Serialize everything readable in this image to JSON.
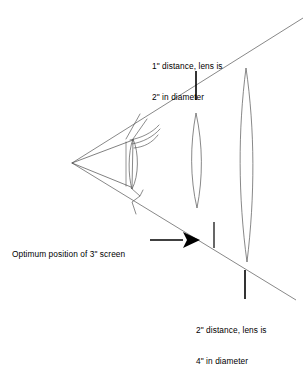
{
  "diagram": {
    "labels": {
      "top": {
        "line1": "1\" distance, lens is",
        "line2": "2\" in diameter"
      },
      "bottom_right": {
        "line1": "2\" distance, lens is",
        "line2": "4\" in diameter"
      },
      "left": {
        "line1": "Optimum position of 3\" screen"
      }
    },
    "icons": {
      "arrow": "right-arrow-icon",
      "hand": "hand-holding-lens-icon",
      "lens_near": "lens-ellipse-icon",
      "lens_far": "lens-ellipse-icon"
    },
    "colors": {
      "background": "#ffffff",
      "line": "#555555",
      "text": "#000000",
      "arrow": "#000000"
    }
  }
}
